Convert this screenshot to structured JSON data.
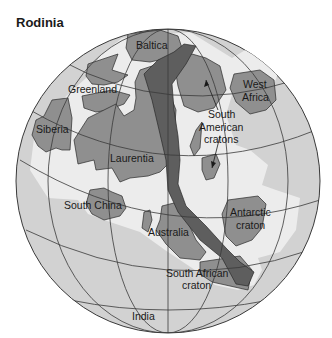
{
  "title": "Rodinia",
  "colors": {
    "ocean": "#d2d2d2",
    "shelf": "#ececec",
    "craton": "#8f8f8f",
    "orogen": "#5e5e5e",
    "grid": "#3a3a3a",
    "text": "#1a1a1a"
  },
  "labels": {
    "baltica": "Baltica",
    "greenland": "Greenland",
    "west_africa_1": "West",
    "west_africa_2": "Africa",
    "siberia": "Siberia",
    "south_american_1": "South",
    "south_american_2": "American",
    "south_american_3": "cratons",
    "laurentia": "Laurentia",
    "south_china": "South China",
    "australia": "Australia",
    "antarctic_1": "Antarctic",
    "antarctic_2": "craton",
    "south_african_1": "South African",
    "south_african_2": "craton",
    "india": "India"
  }
}
